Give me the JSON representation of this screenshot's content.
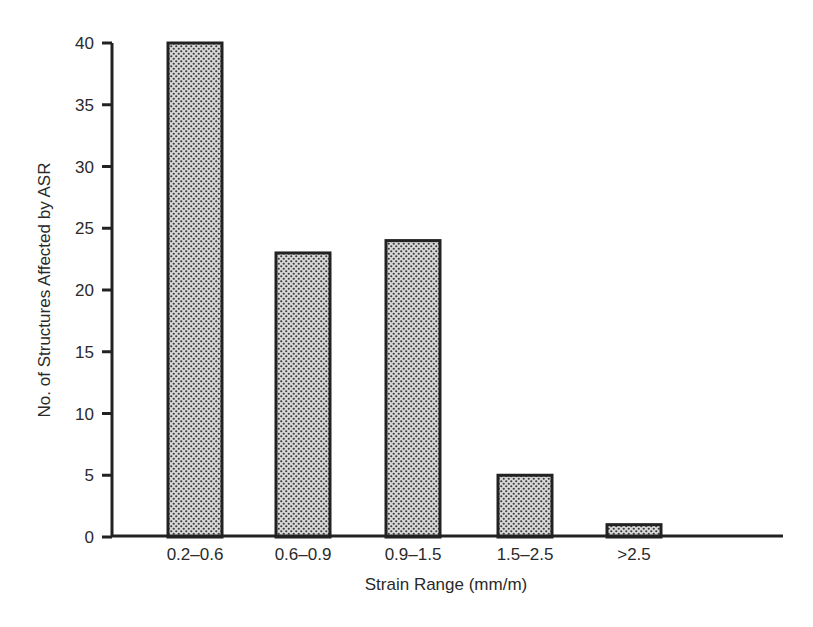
{
  "chart_data": {
    "type": "bar",
    "title": "",
    "xlabel": "Strain Range (mm/m)",
    "ylabel": "No. of Structures Affected by ASR",
    "categories": [
      "0.2–0.6",
      "0.6–0.9",
      "0.9–1.5",
      "1.5–2.5",
      ">2.5"
    ],
    "values": [
      40,
      23,
      24,
      5,
      1
    ],
    "ylim": [
      0,
      40
    ],
    "yticks": [
      0,
      5,
      10,
      15,
      20,
      25,
      30,
      35,
      40
    ],
    "grid": false,
    "legend": null,
    "bar_fill": "stippled gray",
    "colors": {
      "bar_fill": "#b8b8b8",
      "bar_dot": "#3a3a3a",
      "bar_edge": "#222222",
      "axis": "#222222"
    }
  }
}
